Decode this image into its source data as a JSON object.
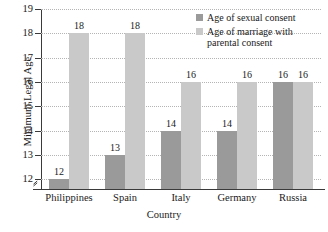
{
  "chart_data": {
    "type": "bar",
    "title": "",
    "xlabel": "Country",
    "ylabel": "Minimum Legal Age",
    "categories": [
      "Philippines",
      "Spain",
      "Italy",
      "Germany",
      "Russia"
    ],
    "series": [
      {
        "name": "Age of sexual consent",
        "color": "#9a9a9a",
        "values": [
          12,
          13,
          14,
          14,
          16
        ]
      },
      {
        "name": "Age of marriage with parental consent",
        "color": "#c9c9c9",
        "values": [
          18,
          18,
          16,
          16,
          16
        ]
      }
    ],
    "ylim": [
      11.6,
      19
    ],
    "yticks": [
      12,
      13,
      14,
      15,
      16,
      17,
      18,
      19
    ],
    "ytick_labels": [
      "12",
      "13",
      "14",
      "15",
      "16",
      "17",
      "18",
      "19"
    ],
    "grid": true,
    "grid_style": "dotted",
    "axis_break": true,
    "legend_position": "top-right-inside",
    "value_labels": true,
    "bar_labels": [
      [
        "12",
        "18"
      ],
      [
        "13",
        "18"
      ],
      [
        "14",
        "16"
      ],
      [
        "14",
        "16"
      ],
      [
        "16",
        "16"
      ]
    ]
  },
  "legend": {
    "entries": [
      "Age of sexual consent",
      "Age of marriage with\nparental consent"
    ]
  }
}
